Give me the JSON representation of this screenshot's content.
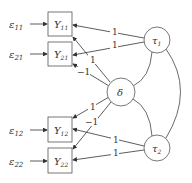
{
  "diagram": {
    "type": "path-diagram",
    "errors": [
      {
        "id": "e11",
        "label": "ε",
        "sub": "11"
      },
      {
        "id": "e21",
        "label": "ε",
        "sub": "21"
      },
      {
        "id": "e12",
        "label": "ε",
        "sub": "12"
      },
      {
        "id": "e22",
        "label": "ε",
        "sub": "22"
      }
    ],
    "observed": [
      {
        "id": "Y11",
        "label": "Y",
        "sub": "11"
      },
      {
        "id": "Y21",
        "label": "Y",
        "sub": "21"
      },
      {
        "id": "Y12",
        "label": "Y",
        "sub": "12"
      },
      {
        "id": "Y22",
        "label": "Y",
        "sub": "22"
      }
    ],
    "latent": [
      {
        "id": "tau1",
        "label": "τ",
        "sub": "1"
      },
      {
        "id": "delta",
        "label": "δ",
        "sub": ""
      },
      {
        "id": "tau2",
        "label": "τ",
        "sub": "2"
      }
    ],
    "loadings": {
      "tau1_Y11": "1",
      "tau1_Y21": "1",
      "delta_Y11": "1",
      "delta_Y21": "−1",
      "delta_Y12": "1",
      "delta_Y22": "−1",
      "tau2_Y12": "1",
      "tau2_Y22": "1"
    }
  }
}
